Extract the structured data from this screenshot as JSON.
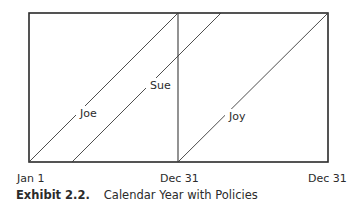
{
  "diagram": {
    "frame": {
      "x1": 29,
      "y1": 13,
      "x2": 328,
      "y2": 162
    },
    "divider_x": 178,
    "policies": [
      {
        "name": "Joe",
        "start": "Jan 1",
        "x1": 29,
        "y1": 162,
        "x2": 178,
        "y2": 13,
        "label_x": 80,
        "label_y": 117
      },
      {
        "name": "Sue",
        "start": "mid-year",
        "x1": 72,
        "y1": 162,
        "x2": 221,
        "y2": 13,
        "label_x": 150,
        "label_y": 89
      },
      {
        "name": "Joy",
        "start": "Dec 31",
        "x1": 178,
        "y1": 162,
        "x2": 328,
        "y2": 13,
        "label_x": 229,
        "label_y": 120
      }
    ],
    "axis_labels": [
      {
        "text": "Jan 1",
        "x": 17,
        "y": 182
      },
      {
        "text": "Dec 31",
        "x": 160,
        "y": 182
      },
      {
        "text": "Dec 31",
        "x": 308,
        "y": 182
      }
    ]
  },
  "caption": {
    "number": "Exhibit 2.2.",
    "title": "Calendar Year with Policies"
  }
}
